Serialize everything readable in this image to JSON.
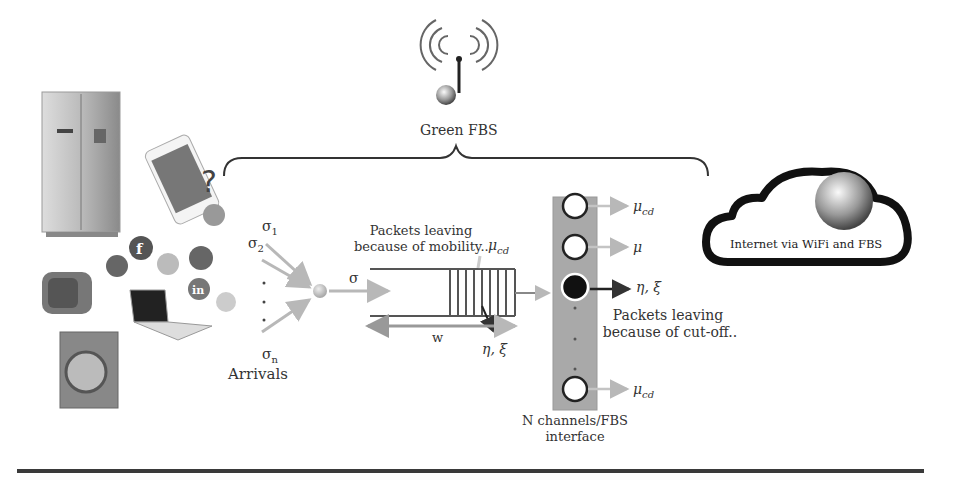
{
  "title": "Green FBS",
  "fbs": {
    "label": "Green FBS"
  },
  "devices": {
    "items": [
      "refrigerator",
      "smartphone",
      "toaster",
      "laptop",
      "washing-machine"
    ],
    "social_icons": [
      "google-plus",
      "facebook",
      "twitter",
      "pinterest",
      "linkedin",
      "rss"
    ],
    "question_mark": "?"
  },
  "arrivals": {
    "sigma1": "σ",
    "sigma1_sub": "1",
    "sigma2": "σ",
    "sigma2_sub": "2",
    "sigman": "σ",
    "sigman_sub": "n",
    "label": "Arrivals",
    "merged": "σ"
  },
  "queue": {
    "mobility_line1": "Packets leaving",
    "mobility_line2": "because of  mobility..",
    "mobility_mu": "μ",
    "mobility_mu_sub": "cd",
    "w_label": "w",
    "eta_xi": "η, ξ"
  },
  "channels": {
    "label_line1": "N channels/FBS",
    "label_line2": "interface",
    "outputs": [
      {
        "sym": "μ",
        "sub": "cd"
      },
      {
        "sym": "μ",
        "sub": ""
      },
      {
        "sym": "η, ξ",
        "sub": ""
      },
      {
        "sym": "μ",
        "sub": "cd"
      }
    ],
    "cutoff_line1": "Packets leaving",
    "cutoff_line2": "because of cut-off.."
  },
  "cloud": {
    "label": "Internet via WiFi and FBS"
  },
  "colors": {
    "ink": "#333333",
    "grey_arrow": "#b8b8b8",
    "panel": "#a9a9a9",
    "rule": "#3a3a3a"
  }
}
